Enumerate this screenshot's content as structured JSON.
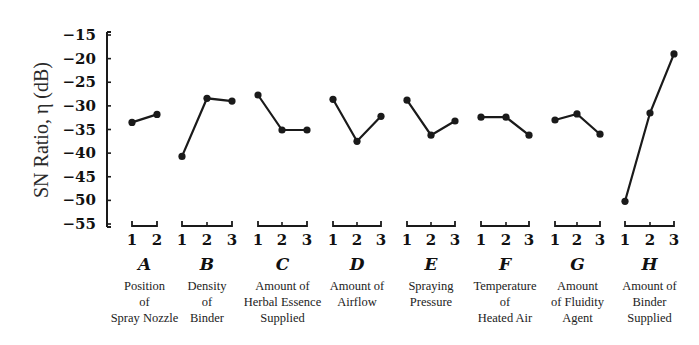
{
  "chart_data": {
    "type": "line",
    "title": "",
    "ylabel": "SN Ratio, η (dB)",
    "xlabel": "",
    "ylim": [
      -55,
      -15
    ],
    "yticks": [
      -15,
      -20,
      -25,
      -30,
      -35,
      -40,
      -45,
      -50,
      -55
    ],
    "grid": false,
    "legend": null,
    "factors": [
      {
        "letter": "A",
        "name": [
          "Position",
          "of",
          "Spray Nozzle"
        ],
        "levels": [
          "1",
          "2"
        ],
        "values": [
          -33.5,
          -31.8
        ]
      },
      {
        "letter": "B",
        "name": [
          "Density",
          "of",
          "Binder"
        ],
        "levels": [
          "1",
          "2",
          "3"
        ],
        "values": [
          -40.7,
          -28.4,
          -29.0
        ]
      },
      {
        "letter": "C",
        "name": [
          "Amount of",
          "Herbal Essence",
          "Supplied"
        ],
        "levels": [
          "1",
          "2",
          "3"
        ],
        "values": [
          -27.7,
          -35.1,
          -35.1
        ]
      },
      {
        "letter": "D",
        "name": [
          "Amount of",
          "Airflow"
        ],
        "levels": [
          "1",
          "2",
          "3"
        ],
        "values": [
          -28.6,
          -37.5,
          -32.2
        ]
      },
      {
        "letter": "E",
        "name": [
          "Spraying",
          "Pressure"
        ],
        "levels": [
          "1",
          "2",
          "3"
        ],
        "values": [
          -28.8,
          -36.2,
          -33.2
        ]
      },
      {
        "letter": "F",
        "name": [
          "Temperature",
          "of",
          "Heated Air"
        ],
        "levels": [
          "1",
          "2",
          "3"
        ],
        "values": [
          -32.4,
          -32.4,
          -36.2
        ]
      },
      {
        "letter": "G",
        "name": [
          "Amount",
          "of Fluidity",
          "Agent"
        ],
        "levels": [
          "1",
          "2",
          "3"
        ],
        "values": [
          -33.0,
          -31.7,
          -36.0
        ]
      },
      {
        "letter": "H",
        "name": [
          "Amount of",
          "Binder",
          "Supplied"
        ],
        "levels": [
          "1",
          "2",
          "3"
        ],
        "values": [
          -50.2,
          -31.5,
          -19.0
        ]
      }
    ]
  },
  "layout": {
    "axis_x": 107,
    "y_top_px": 35,
    "y_bottom_px": 224,
    "factor_x_positions": [
      [
        132,
        157
      ],
      [
        182,
        207,
        232
      ],
      [
        258,
        282,
        307
      ],
      [
        333,
        357,
        381
      ],
      [
        407,
        431,
        455
      ],
      [
        481,
        506,
        529
      ],
      [
        555,
        577,
        600
      ],
      [
        625,
        650,
        674
      ]
    ]
  },
  "colors": {
    "ink": "#1a1a1a",
    "background": "#ffffff"
  }
}
